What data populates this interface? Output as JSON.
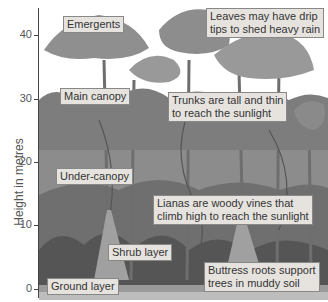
{
  "axis": {
    "label": "Height in metres",
    "ticks": [
      {
        "value": "40",
        "y": 35
      },
      {
        "value": "30",
        "y": 99
      },
      {
        "value": "20",
        "y": 162
      },
      {
        "value": "10",
        "y": 225
      },
      {
        "value": "0",
        "y": 289
      }
    ]
  },
  "labels": {
    "emergents": "Emergents",
    "main_canopy": "Main canopy",
    "under_canopy": "Under-canopy",
    "shrub_layer": "Shrub layer",
    "ground_layer": "Ground layer",
    "drip_tips_1": "Leaves may have drip",
    "drip_tips_2": "tips to shed heavy rain",
    "trunks_1": "Trunks are tall and thin",
    "trunks_2": "to reach the sunlight",
    "lianas_1": "Lianas are woody vines that",
    "lianas_2": "climb high to reach the sunlight",
    "buttress_1": "Buttress roots support",
    "buttress_2": "trees in muddy soil"
  },
  "colors": {
    "foliage": "#8a8a8a",
    "foliage_dark": "#5e5e5e",
    "trunk": "#777777",
    "label_bg": "#e6e3df"
  }
}
